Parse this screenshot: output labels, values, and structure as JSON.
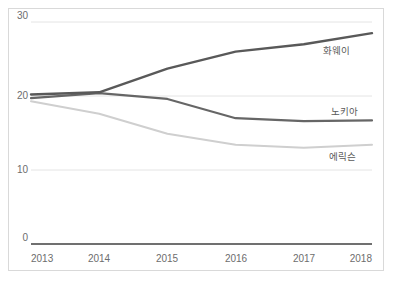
{
  "chart_data": {
    "type": "line",
    "title": "",
    "subtitle": "",
    "xlabel": "",
    "ylabel": "",
    "categories": [
      "2013",
      "2014",
      "2015",
      "2016",
      "2017",
      "2018"
    ],
    "x": [
      2013,
      2014,
      2015,
      2016,
      2017,
      2018
    ],
    "xlim": [
      2013,
      2018
    ],
    "ylim": [
      0,
      30
    ],
    "yticks": [
      0,
      10,
      20,
      30
    ],
    "ytick_labels": [
      "0",
      "10",
      "20",
      "30"
    ],
    "xtick_labels": [
      "2013",
      "2014",
      "2015",
      "2016",
      "2017",
      "2018"
    ],
    "grid": true,
    "grid_axis": "y",
    "legend": "inline-end-labels",
    "legend_position": "right",
    "series": [
      {
        "name": "화웨이",
        "label": "화웨이",
        "color": "#595959",
        "width": 2.4,
        "values": [
          20.2,
          20.5,
          23.7,
          26.0,
          27.0,
          28.5
        ],
        "label_x": 2017.2,
        "label_y": 25.9
      },
      {
        "name": "노키아",
        "label": "노키아",
        "color": "#666666",
        "width": 2.2,
        "values": [
          19.7,
          20.4,
          19.6,
          17.0,
          16.6,
          16.7
        ],
        "label_x": 2017.2,
        "label_y": 18.3
      },
      {
        "name": "에릭슨",
        "label": "에릭슨",
        "color": "#cfcfcf",
        "width": 2.0,
        "values": [
          19.3,
          17.6,
          14.9,
          13.4,
          13.0,
          13.4
        ],
        "label_x": 2017.2,
        "label_y": 11.9
      }
    ],
    "axis_color": "#404040",
    "grid_color": "#e4e4e4",
    "tick_label_color": "#6d6d6d",
    "border_color": "#d9d9d9",
    "background": "#ffffff"
  },
  "axis": {
    "y_labels": [
      "30",
      "20",
      "10",
      "0"
    ],
    "x_labels": [
      "2013",
      "2014",
      "2015",
      "2016",
      "2017",
      "2018"
    ]
  }
}
